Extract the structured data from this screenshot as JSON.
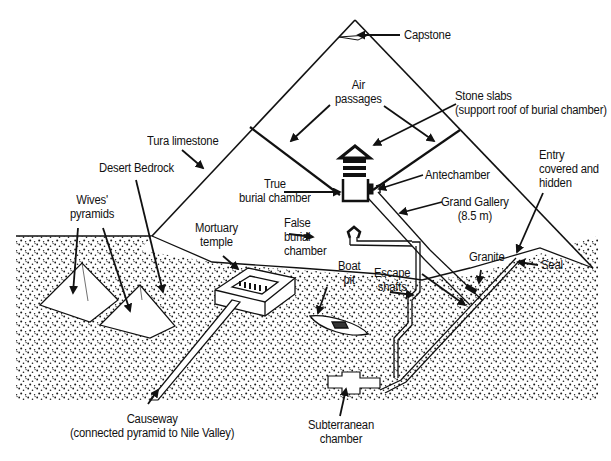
{
  "diagram": {
    "colors": {
      "ink": "#111111",
      "background": "#ffffff",
      "stipple": "#1a1a1a"
    },
    "labels": {
      "capstone": "Capstone",
      "air_passages": [
        "Air",
        "passages"
      ],
      "stone_slabs": [
        "Stone slabs",
        "(support roof of burial chamber)"
      ],
      "tura_limestone": "Tura limestone",
      "desert_bedrock": "Desert Bedrock",
      "entry": [
        "Entry",
        "covered and",
        "hidden"
      ],
      "true_burial_chamber": [
        "True",
        "burial chamber"
      ],
      "antechamber": "Antechamber",
      "grand_gallery": [
        "Grand Gallery",
        "(8.5 m)"
      ],
      "wives_pyramids": [
        "Wives'",
        "pyramids"
      ],
      "mortuary_temple": [
        "Mortuary",
        "temple"
      ],
      "false_burial_chamber": [
        "False",
        "burial",
        "chamber"
      ],
      "granite": "Granite",
      "seal": "Seal",
      "boat_pit": [
        "Boat",
        "pit"
      ],
      "escape_shafts": [
        "Escape",
        "shafts"
      ],
      "causeway": [
        "Causeway",
        "(connected pyramid to Nile Valley)"
      ],
      "subterranean_chamber": [
        "Subterranean",
        "chamber"
      ]
    }
  }
}
